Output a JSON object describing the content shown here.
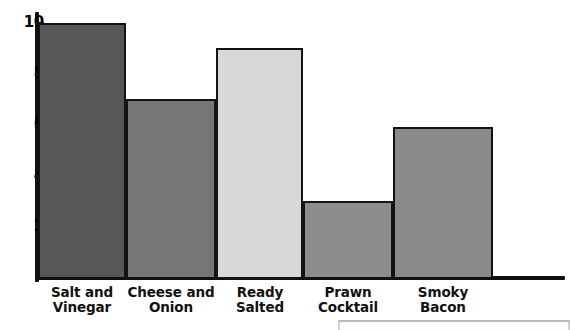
{
  "chart_data": {
    "type": "bar",
    "title": "",
    "subtitle": "",
    "xlabel": "",
    "ylabel": "",
    "categories": [
      "Salt and Vinegar",
      "Cheese and Onion",
      "Ready Salted",
      "Prawn Cocktail",
      "Smoky Bacon"
    ],
    "values": [
      10,
      7,
      9,
      3,
      5.9
    ],
    "ylim": [
      0,
      10.4
    ],
    "y_ticks": [
      2,
      4,
      6,
      8,
      10
    ],
    "y_tick_labels": [
      "2",
      "4",
      "6",
      "8",
      "10"
    ],
    "grid": false,
    "legend": null,
    "bar_colors": [
      "#575757",
      "#767676",
      "#d8d8d8",
      "#8d8d8d",
      "#8a8a8a"
    ],
    "bar_outline_color": "#131313",
    "axis_color": "#111111"
  },
  "axis": {
    "y_tick_labels": [
      "10",
      "8",
      "6",
      "4",
      "2"
    ]
  },
  "bars": [
    {
      "label_line1": "Salt and",
      "label_line2": "Vinegar",
      "value": 10,
      "color": "#575757"
    },
    {
      "label_line1": "Cheese and",
      "label_line2": "Onion",
      "value": 7,
      "color": "#767676"
    },
    {
      "label_line1": "Ready",
      "label_line2": "Salted",
      "value": 9,
      "color": "#d8d8d8"
    },
    {
      "label_line1": "Prawn",
      "label_line2": "Cocktail",
      "value": 3,
      "color": "#8d8d8d"
    },
    {
      "label_line1": "Smoky",
      "label_line2": "Bacon",
      "value": 5.9,
      "color": "#8a8a8a"
    }
  ]
}
